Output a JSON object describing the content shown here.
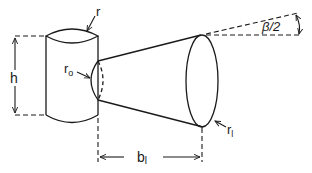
{
  "diagram": {
    "title": "",
    "labels": {
      "cylinder_radius": "r",
      "height": "h",
      "inner_radius": "r",
      "inner_radius_sub": "o",
      "beam_angle": "β/2",
      "distance": "b",
      "distance_sub": "l",
      "outer_radius": "r",
      "outer_radius_sub": "l"
    },
    "colors": {
      "stroke": "#1a1a1a",
      "background": "#ffffff"
    }
  }
}
